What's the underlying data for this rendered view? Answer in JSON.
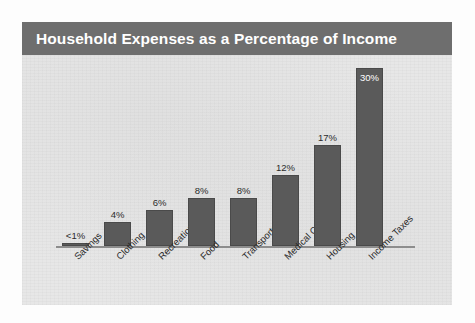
{
  "figure": {
    "title": "Household Expenses as a Percentage of Income",
    "title_bar_color": "#6e6e6e",
    "title_text_color": "#ffffff",
    "plot_background_color": "#e7e7e7",
    "bar_color": "#5a5a5a",
    "axis_color": "#8d8d8d"
  },
  "chart_data": {
    "type": "bar",
    "title": "Household Expenses as a Percentage of Income",
    "xlabel": "",
    "ylabel": "",
    "ylim": [
      0,
      32
    ],
    "grid": false,
    "legend": null,
    "categories": [
      "Savings",
      "Clothing",
      "Recreation",
      "Food",
      "Transportation",
      "Medical Care",
      "Housing",
      "Income Taxes"
    ],
    "values": [
      0.5,
      4,
      6,
      8,
      8,
      12,
      17,
      30
    ],
    "value_labels": [
      "<1%",
      "4%",
      "6%",
      "8%",
      "8%",
      "12%",
      "17%",
      "30%"
    ],
    "label_placement": [
      "above",
      "above",
      "above",
      "above",
      "above",
      "above",
      "above",
      "inside"
    ]
  }
}
